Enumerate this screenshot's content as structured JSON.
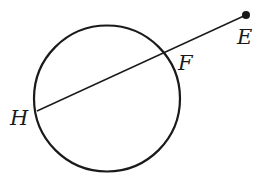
{
  "diagram": {
    "type": "geometry",
    "colors": {
      "stroke": "#1a1a1a",
      "background": "#ffffff"
    },
    "circle": {
      "cx": 107,
      "cy": 98.5,
      "r": 73
    },
    "segment": {
      "from": "E",
      "to": "H",
      "x1": 246,
      "y1": 15,
      "x2": 37,
      "y2": 111
    },
    "points": [
      {
        "name": "E",
        "label": "E",
        "x": 246,
        "y": 15,
        "label_x": 237,
        "label_y": 44,
        "dot": true
      },
      {
        "name": "F",
        "label": "F",
        "x": 164,
        "y": 53,
        "label_x": 178,
        "label_y": 70,
        "dot": false
      },
      {
        "name": "H",
        "label": "H",
        "x": 37,
        "y": 111,
        "label_x": 10,
        "label_y": 125,
        "dot": false
      }
    ]
  }
}
